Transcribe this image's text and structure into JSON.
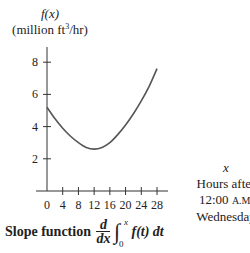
{
  "chart_data": {
    "type": "line",
    "title": "",
    "ylabel_line1": "f(x)",
    "ylabel_line2": "(million ft³/hr)",
    "xlabel": [
      "x",
      "Hours after",
      "12:00 A.M.",
      "Wednesday"
    ],
    "x_ticks": [
      0,
      4,
      8,
      12,
      16,
      20,
      24,
      28
    ],
    "y_ticks": [
      2,
      4,
      6,
      8
    ],
    "xlim": [
      0,
      28
    ],
    "ylim": [
      0,
      9
    ],
    "grid": false,
    "series": [
      {
        "name": "f(x)",
        "x": [
          0,
          2,
          4,
          6,
          8,
          10,
          12,
          14,
          16,
          18,
          20,
          22,
          24,
          26,
          28
        ],
        "values": [
          5.2,
          4.5,
          3.9,
          3.4,
          3.0,
          2.7,
          2.6,
          2.7,
          3.0,
          3.5,
          4.1,
          4.8,
          5.6,
          6.5,
          7.6
        ]
      }
    ],
    "caption": "Slope function d/dx ∫₀ˣ f(t) dt"
  },
  "labels": {
    "y_fx": "f(x)",
    "y_units_pre": "(million ft",
    "y_units_sup": "3",
    "y_units_post": "/hr)",
    "x_var": "x",
    "x_line1": "Hours after",
    "x_line2_num": "12:00 ",
    "x_line2_sc": "A.M.",
    "x_line3": "Wednesday",
    "caption_text": "Slope function",
    "frac_num": "d",
    "frac_den": "dx",
    "integral": "∫",
    "int_upper": "x",
    "int_lower": "0",
    "integrand": "f(t) dt"
  }
}
